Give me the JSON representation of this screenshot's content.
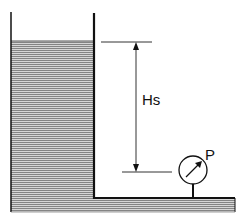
{
  "diagram": {
    "type": "hydrostatic head diagram",
    "labels": {
      "head": "Hs",
      "pressure": "P"
    },
    "elements": [
      "tank with liquid (hatched)",
      "water surface level line",
      "dimension arrow Hs from surface to gauge level",
      "pressure gauge P on floor pipe"
    ],
    "colors": {
      "line": "#111111",
      "fill_hatch": "#9a9a9a",
      "background": "#ffffff"
    }
  }
}
